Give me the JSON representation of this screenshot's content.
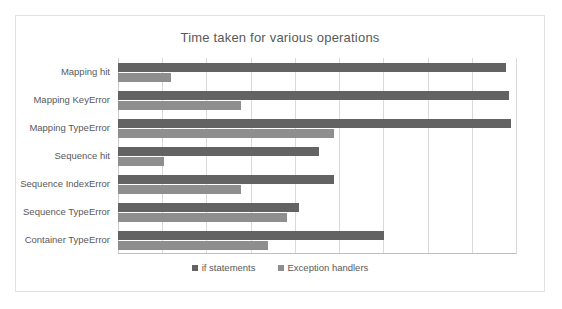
{
  "chart_data": {
    "type": "bar",
    "orientation": "horizontal",
    "title": "Time taken for various operations",
    "xlabel": "",
    "ylabel": "",
    "grid": true,
    "legend_position": "bottom",
    "xlim": [
      0,
      9
    ],
    "x_gridline_count": 10,
    "categories": [
      "Mapping hit",
      "Mapping KeyError",
      "Mapping TypeError",
      "Sequence hit",
      "Sequence IndexError",
      "Sequence TypeError",
      "Container TypeError"
    ],
    "series": [
      {
        "name": "if statements",
        "color": "#636363",
        "values": [
          8.77,
          8.84,
          8.89,
          4.55,
          4.89,
          4.09,
          6.02
        ]
      },
      {
        "name": "Exception handlers",
        "color": "#8e8e8e",
        "values": [
          1.2,
          2.78,
          4.89,
          1.04,
          2.78,
          3.82,
          3.39
        ]
      }
    ]
  },
  "legend": {
    "items": [
      {
        "label": "if statements",
        "swatch": "legend-swatch-dark"
      },
      {
        "label": "Exception handlers",
        "swatch": "legend-swatch-light"
      }
    ]
  },
  "colors": {
    "series_if_statements": "#636363",
    "series_exception_handlers": "#8e8e8e",
    "gridline": "#d9d9d9",
    "axis": "#bfbfbf",
    "text": "#595959",
    "frame_border": "#e2e2e2",
    "background": "#ffffff"
  }
}
